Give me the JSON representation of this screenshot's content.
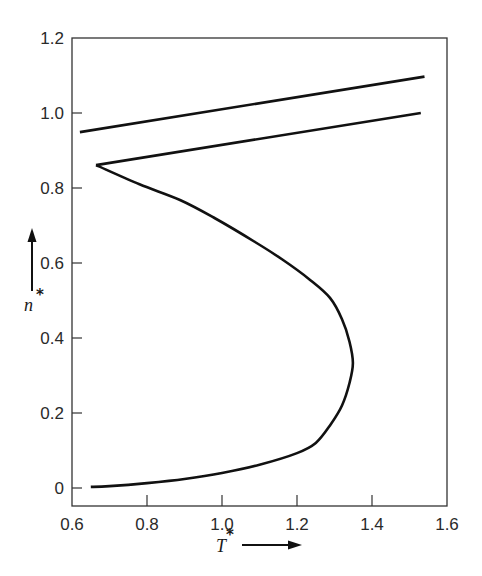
{
  "chart_data": {
    "type": "line",
    "title": "",
    "xlabel": "T*",
    "ylabel": "n*",
    "xlim": [
      0.6,
      1.6
    ],
    "ylim": [
      0.0,
      1.2
    ],
    "x_ticks": [
      "0.6",
      "0.8",
      "1.0",
      "1.2",
      "1.4",
      "1.6"
    ],
    "y_ticks": [
      "0",
      "0.2",
      "0.4",
      "0.6",
      "0.8",
      "1.0",
      "1.2"
    ],
    "grid": false,
    "legend": null,
    "series": [
      {
        "name": "coexistence curve (gas / liquid branch)",
        "points": [
          [
            0.65,
            0.003
          ],
          [
            0.7,
            0.005
          ],
          [
            0.8,
            0.013
          ],
          [
            0.9,
            0.024
          ],
          [
            1.0,
            0.04
          ],
          [
            1.1,
            0.062
          ],
          [
            1.2,
            0.093
          ],
          [
            1.25,
            0.12
          ],
          [
            1.29,
            0.17
          ],
          [
            1.32,
            0.22
          ],
          [
            1.34,
            0.28
          ],
          [
            1.349,
            0.333
          ],
          [
            1.34,
            0.39
          ],
          [
            1.32,
            0.45
          ],
          [
            1.288,
            0.507
          ],
          [
            1.235,
            0.555
          ],
          [
            1.16,
            0.61
          ],
          [
            1.088,
            0.656
          ],
          [
            0.98,
            0.72
          ],
          [
            0.888,
            0.768
          ],
          [
            0.78,
            0.81
          ],
          [
            0.664,
            0.861
          ]
        ]
      },
      {
        "name": "lower straight line (from cusp)",
        "points": [
          [
            0.664,
            0.861
          ],
          [
            1.53,
            1.0
          ]
        ]
      },
      {
        "name": "upper straight line",
        "points": [
          [
            0.621,
            0.949
          ],
          [
            1.54,
            1.097
          ]
        ]
      }
    ],
    "annotations": [
      "arrow on y-axis label n*",
      "arrow on x-axis label T*"
    ]
  },
  "axes": {
    "x_label": "T",
    "x_label_sup": "*",
    "y_label": "n",
    "y_label_sup": "*",
    "x_ticks": [
      {
        "label": "0.6",
        "value": 0.6
      },
      {
        "label": "0.8",
        "value": 0.8
      },
      {
        "label": "1.0",
        "value": 1.0
      },
      {
        "label": "1.2",
        "value": 1.2
      },
      {
        "label": "1.4",
        "value": 1.4
      },
      {
        "label": "1.6",
        "value": 1.6
      }
    ],
    "y_ticks": [
      {
        "label": "0",
        "value": 0
      },
      {
        "label": "0.2",
        "value": 0.2
      },
      {
        "label": "0.4",
        "value": 0.4
      },
      {
        "label": "0.6",
        "value": 0.6
      },
      {
        "label": "0.8",
        "value": 0.8
      },
      {
        "label": "1.0",
        "value": 1.0
      },
      {
        "label": "1.2",
        "value": 1.2
      }
    ]
  },
  "colors": {
    "line": "#111111",
    "frame": "#333333",
    "background": "#ffffff"
  }
}
